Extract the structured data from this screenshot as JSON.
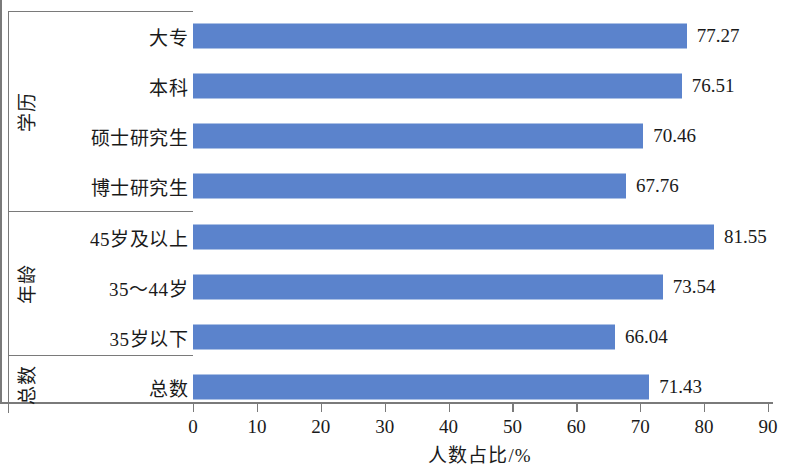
{
  "chart_data": {
    "type": "bar",
    "orientation": "horizontal",
    "title": "",
    "xlabel": "人数占比/%",
    "ylabel": "",
    "xlim": [
      0,
      90
    ],
    "xticks": [
      0,
      10,
      20,
      30,
      40,
      50,
      60,
      70,
      80,
      90
    ],
    "grid": false,
    "legend": false,
    "bar_color": "#5b83cc",
    "axis_color": "#7a7a7a",
    "categories": [
      "大专",
      "本科",
      "硕士研究生",
      "博士研究生",
      "45岁及以上",
      "35～44岁",
      "35岁以下",
      "总数"
    ],
    "values": [
      77.27,
      76.51,
      70.46,
      67.76,
      81.55,
      73.54,
      66.04,
      71.43
    ],
    "value_labels": [
      "77.27",
      "76.51",
      "70.46",
      "67.76",
      "81.55",
      "73.54",
      "66.04",
      "71.43"
    ],
    "groups": [
      {
        "label": "学历",
        "categories": [
          "大专",
          "本科",
          "硕士研究生",
          "博士研究生"
        ]
      },
      {
        "label": "年龄",
        "categories": [
          "45岁及以上",
          "35～44岁",
          "35岁以下"
        ]
      },
      {
        "label": "总数",
        "categories": [
          "总数"
        ]
      }
    ]
  }
}
